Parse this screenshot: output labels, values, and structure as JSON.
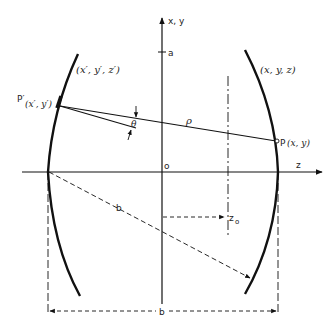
{
  "diagram": {
    "labels": {
      "y_axis": "x, y",
      "a_mark": "a",
      "origin": "o",
      "z_axis": "z",
      "z0": "z",
      "z0_sub": "o",
      "left_surface": "(x′, y′, z′)",
      "right_surface": "(x, y, z)",
      "p_prime": "P′",
      "p_prime_coords": "(x′, y′)",
      "p_point": "P",
      "p_coords": "(x, y)",
      "rho": "ρ",
      "theta": "θ",
      "b_diag": "b",
      "b_bottom": "b"
    },
    "colors": {
      "line": "#111111",
      "background": "#ffffff"
    }
  }
}
